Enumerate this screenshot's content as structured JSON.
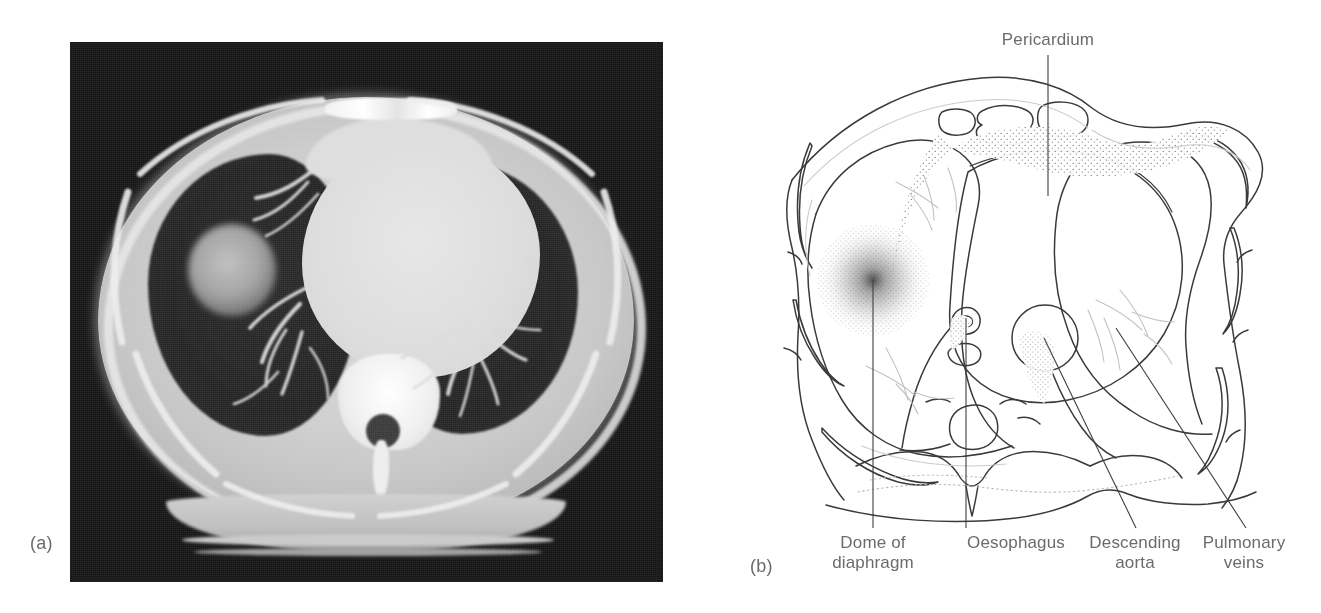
{
  "figure": {
    "panels": [
      {
        "tag": "(a)",
        "kind": "ct-scan",
        "modality_description": "Axial CT section of the thorax"
      },
      {
        "tag": "(b)",
        "kind": "line-diagram",
        "modality_description": "Labelled line drawing of the same axial section"
      }
    ]
  },
  "panel_a": {
    "tag": "(a)",
    "background_color": "#161616",
    "features": [
      "chest wall and subcutaneous fat",
      "right lung",
      "left lung",
      "rounded soft-tissue lesion in right lung",
      "heart and mediastinum",
      "sternum and costal cartilage",
      "vertebral body",
      "spinal canal",
      "pulmonary vessels",
      "posterior chest wall and scanner table"
    ]
  },
  "panel_b": {
    "tag": "(b)",
    "stroke_color": "#3a3a3a",
    "faint_stroke_color": "#b9b9b9",
    "stipple_color": "#707070",
    "labels": [
      {
        "id": "pericardium",
        "text": "Pericardium",
        "position": "top-center",
        "leader": "vertical"
      },
      {
        "id": "dome-of-diaphragm",
        "text": "Dome of\ndiaphragm",
        "position": "bottom-left",
        "leader": "vertical"
      },
      {
        "id": "oesophagus",
        "text": "Oesophagus",
        "position": "bottom-center",
        "leader": "vertical"
      },
      {
        "id": "descending-aorta",
        "text": "Descending\naorta",
        "position": "bottom-center-right",
        "leader": "diagonal"
      },
      {
        "id": "pulmonary-veins",
        "text": "Pulmonary\nveins",
        "position": "bottom-right",
        "leader": "diagonal"
      }
    ],
    "structures": [
      "skin / body wall outline",
      "ribs",
      "costal cartilage",
      "mediastinal fat (stippled)",
      "pericardium",
      "heart outline",
      "oesophagus",
      "descending aorta",
      "vertebral body and spinal canal",
      "paraspinal muscles",
      "pulmonary vessels (faint)",
      "dome of diaphragm (stippled)"
    ]
  },
  "colors": {
    "page_background": "#ffffff",
    "label_text": "#6b6b6b",
    "ct_dark": "#161616",
    "ct_soft_tissue": "#cfcfcf",
    "ct_lung": "#262626",
    "ct_bone": "#f0f0f0"
  }
}
